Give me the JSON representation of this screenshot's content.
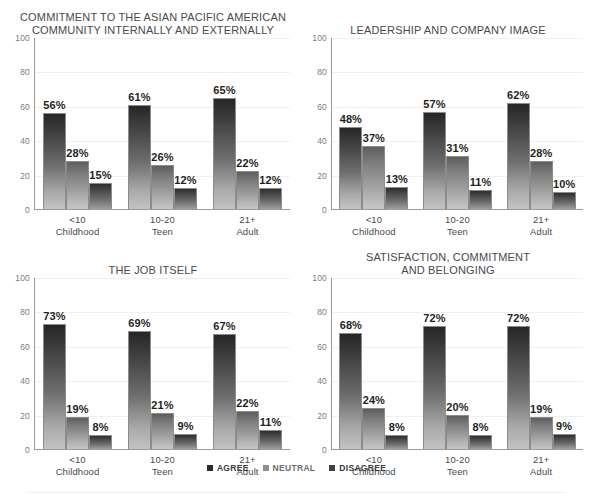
{
  "legend": {
    "items": [
      {
        "label": "AGREE",
        "swatch": "legend-swatch-agree",
        "color": "#2b2b2b"
      },
      {
        "label": "NEUTRAL",
        "swatch": "legend-swatch-neutral",
        "color": "#8f8f8f"
      },
      {
        "label": "DISAGREE",
        "swatch": "legend-swatch-disagree",
        "color": "#3f3f3f"
      }
    ]
  },
  "axis": {
    "y_ticks": [
      "100",
      "80",
      "60",
      "40",
      "20",
      "0"
    ],
    "y_values": [
      100,
      80,
      60,
      40,
      20,
      0
    ]
  },
  "categories": [
    {
      "line1": "<10",
      "line2": "Childhood"
    },
    {
      "line1": "10-20",
      "line2": "Teen"
    },
    {
      "line1": "21+",
      "line2": "Adult"
    }
  ],
  "chart_data": [
    {
      "type": "bar",
      "id": "commitment-to-apa-community",
      "title": "COMMITMENT TO THE ASIAN PACIFIC AMERICAN\nCOMMUNITY INTERNALLY AND EXTERNALLY",
      "xlabel": "",
      "ylabel": "",
      "ylim": [
        0,
        100
      ],
      "yticks": [
        0,
        20,
        40,
        60,
        80,
        100
      ],
      "grid": true,
      "legend_position": "bottom-center-shared",
      "categories": [
        "<10 Childhood",
        "10-20 Teen",
        "21+ Adult"
      ],
      "series": [
        {
          "name": "AGREE",
          "values": [
            56,
            61,
            65
          ],
          "labels": [
            "56%",
            "61%",
            "65%"
          ]
        },
        {
          "name": "NEUTRAL",
          "values": [
            28,
            26,
            22
          ],
          "labels": [
            "28%",
            "26%",
            "22%"
          ]
        },
        {
          "name": "DISAGREE",
          "values": [
            15,
            12,
            12
          ],
          "labels": [
            "15%",
            "12%",
            "12%"
          ]
        }
      ]
    },
    {
      "type": "bar",
      "id": "leadership-and-company-image",
      "title": "LEADERSHIP AND COMPANY IMAGE",
      "xlabel": "",
      "ylabel": "",
      "ylim": [
        0,
        100
      ],
      "yticks": [
        0,
        20,
        40,
        60,
        80,
        100
      ],
      "grid": true,
      "legend_position": "bottom-center-shared",
      "categories": [
        "<10 Childhood",
        "10-20 Teen",
        "21+ Adult"
      ],
      "series": [
        {
          "name": "AGREE",
          "values": [
            48,
            57,
            62
          ],
          "labels": [
            "48%",
            "57%",
            "62%"
          ]
        },
        {
          "name": "NEUTRAL",
          "values": [
            37,
            31,
            28
          ],
          "labels": [
            "37%",
            "31%",
            "28%"
          ]
        },
        {
          "name": "DISAGREE",
          "values": [
            13,
            11,
            10
          ],
          "labels": [
            "13%",
            "11%",
            "10%"
          ]
        }
      ]
    },
    {
      "type": "bar",
      "id": "the-job-itself",
      "title": "THE JOB ITSELF",
      "xlabel": "",
      "ylabel": "",
      "ylim": [
        0,
        100
      ],
      "yticks": [
        0,
        20,
        40,
        60,
        80,
        100
      ],
      "grid": true,
      "legend_position": "bottom-center-shared",
      "categories": [
        "<10 Childhood",
        "10-20 Teen",
        "21+ Adult"
      ],
      "series": [
        {
          "name": "AGREE",
          "values": [
            73,
            69,
            67
          ],
          "labels": [
            "73%",
            "69%",
            "67%"
          ]
        },
        {
          "name": "NEUTRAL",
          "values": [
            19,
            21,
            22
          ],
          "labels": [
            "19%",
            "21%",
            "22%"
          ]
        },
        {
          "name": "DISAGREE",
          "values": [
            8,
            9,
            11
          ],
          "labels": [
            "8%",
            "9%",
            "11%"
          ]
        }
      ]
    },
    {
      "type": "bar",
      "id": "satisfaction-commitment-belonging",
      "title": "SATISFACTION, COMMITMENT\nAND BELONGING",
      "xlabel": "",
      "ylabel": "",
      "ylim": [
        0,
        100
      ],
      "yticks": [
        0,
        20,
        40,
        60,
        80,
        100
      ],
      "grid": true,
      "legend_position": "bottom-center-shared",
      "categories": [
        "<10 Childhood",
        "10-20 Teen",
        "21+ Adult"
      ],
      "series": [
        {
          "name": "AGREE",
          "values": [
            68,
            72,
            72
          ],
          "labels": [
            "68%",
            "72%",
            "72%"
          ]
        },
        {
          "name": "NEUTRAL",
          "values": [
            24,
            20,
            19
          ],
          "labels": [
            "24%",
            "20%",
            "19%"
          ]
        },
        {
          "name": "DISAGREE",
          "values": [
            8,
            8,
            9
          ],
          "labels": [
            "8%",
            "8%",
            "9%"
          ]
        }
      ]
    }
  ]
}
